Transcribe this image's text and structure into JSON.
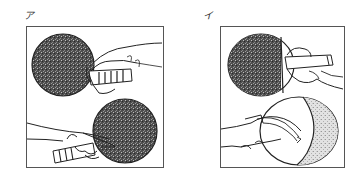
{
  "figure": {
    "panels": [
      {
        "label": "ア",
        "subject": "shakehand grip - forehand and backhand views of table tennis racket",
        "illustrations": [
          "racket-held-from-right-with-hand-over-handle",
          "racket-held-from-left-with-index-finger-on-rubber"
        ],
        "rubber_colors": [
          "dark",
          "dark"
        ]
      },
      {
        "label": "イ",
        "subject": "penhold grip - front and back views of table tennis racket",
        "illustrations": [
          "racket-front-with-thumb-and-finger-on-handle",
          "racket-back-with-fingers-resting-on-face"
        ],
        "rubber_colors": [
          "dark",
          "light-speckled"
        ]
      }
    ],
    "colors": {
      "border": "#555555",
      "dark_rubber": "#5a5a5a",
      "light_rubber": "#d6d6d6",
      "line": "#222222",
      "background": "#ffffff"
    }
  }
}
